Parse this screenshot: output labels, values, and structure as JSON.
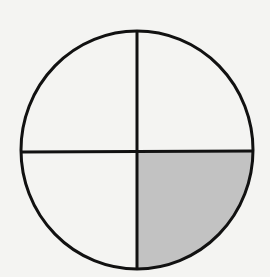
{
  "diagram": {
    "type": "fraction-circle",
    "total_parts": 4,
    "shaded_parts": 1,
    "fraction": "1/4",
    "shaded_quadrant": "bottom-right",
    "colors": {
      "background": "#f4f4f2",
      "outline": "#111111",
      "shaded_fill": "#c2c2c2",
      "unshaded_fill": "#f4f4f2"
    },
    "geometry": {
      "cx": 137,
      "cy": 150,
      "rx": 116,
      "ry": 119,
      "stroke_width": 3
    }
  }
}
